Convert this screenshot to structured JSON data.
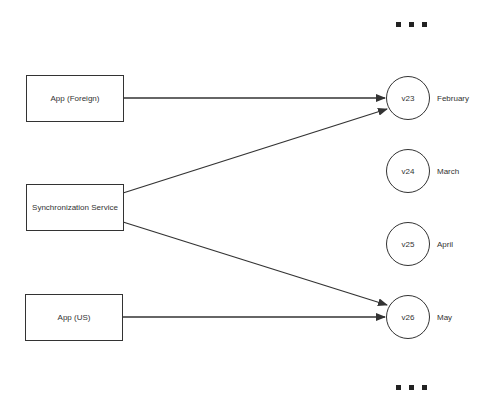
{
  "diagram": {
    "sources": [
      {
        "id": "app-foreign",
        "label": "App (Foreign)"
      },
      {
        "id": "sync-service",
        "label": "Synchronization Service"
      },
      {
        "id": "app-us",
        "label": "App (US)"
      }
    ],
    "versions": [
      {
        "id": "v23",
        "label": "v23",
        "month": "February"
      },
      {
        "id": "v24",
        "label": "v24",
        "month": "March"
      },
      {
        "id": "v25",
        "label": "v25",
        "month": "April"
      },
      {
        "id": "v26",
        "label": "v26",
        "month": "May"
      }
    ],
    "edges": [
      {
        "from": "app-foreign",
        "to": "v23"
      },
      {
        "from": "sync-service",
        "to": "v23"
      },
      {
        "from": "sync-service",
        "to": "v26"
      },
      {
        "from": "app-us",
        "to": "v26"
      }
    ],
    "ellipsis_top": "more-versions-above",
    "ellipsis_bottom": "more-versions-below"
  }
}
